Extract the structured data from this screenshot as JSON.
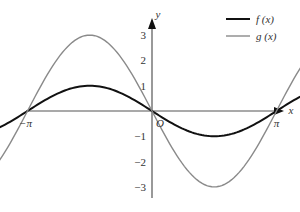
{
  "chart_data": {
    "type": "line",
    "title": "",
    "xlabel": "x",
    "ylabel": "y",
    "origin_label": "O",
    "x_ticks": [
      "−2π",
      "−π",
      "π",
      "2π"
    ],
    "x_tick_values": [
      -6.2832,
      -3.1416,
      3.1416,
      6.2832
    ],
    "y_ticks": [
      "3",
      "2",
      "1",
      "−1",
      "−2",
      "−3"
    ],
    "y_tick_values": [
      3,
      2,
      1,
      -1,
      -2,
      -3
    ],
    "xlim": [
      -6.2832,
      6.2832
    ],
    "ylim": [
      -3.5,
      3.5
    ],
    "grid": false,
    "legend_position": "upper right",
    "series": [
      {
        "name": "f (x)",
        "color": "#111111",
        "expression": "-sin(x)",
        "x": [
          -6.2832,
          -4.7124,
          -3.1416,
          -1.5708,
          0,
          1.5708,
          3.1416,
          4.7124,
          6.2832
        ],
        "values": [
          0,
          1,
          0,
          -1,
          0,
          1,
          0,
          -1,
          0
        ]
      },
      {
        "name": "g (x)",
        "color": "#8a8a8a",
        "expression": "-3sin(x)",
        "x": [
          -6.2832,
          -4.7124,
          -3.1416,
          -1.5708,
          0,
          1.5708,
          3.1416,
          4.7124,
          6.2832
        ],
        "values": [
          0,
          3,
          0,
          -3,
          0,
          3,
          0,
          -3,
          0
        ]
      }
    ]
  },
  "legend": {
    "items": [
      {
        "label": "f (x)",
        "color": "#111111"
      },
      {
        "label": "g (x)",
        "color": "#8a8a8a"
      }
    ]
  }
}
